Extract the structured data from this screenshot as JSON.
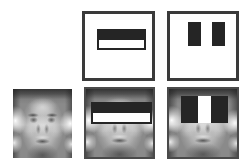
{
  "figure": {
    "background_color": "#ffffff",
    "width": 244,
    "height": 165,
    "grid": {
      "rows": 2,
      "cols": 3
    },
    "dark_color": "#252525",
    "light_color": "#ffffff",
    "border_color": "#3a3a3a",
    "face_frame_color": "#4a4a4a"
  },
  "panels": [
    {
      "id": "top-left-empty",
      "name": "empty-cell",
      "kind": "empty",
      "label": "",
      "x": 2,
      "y": 11,
      "w": 70,
      "h": 70
    },
    {
      "id": "top-middle-template",
      "name": "two-rectangle-feature-template",
      "kind": "feature-template",
      "feature_type": "two-rectangle-horizontal",
      "label": "Two-rectangle feature",
      "description": "Dark band above white band",
      "x": 82,
      "y": 11,
      "w": 73,
      "h": 70,
      "feature": {
        "x": 12,
        "y": 15,
        "w": 49,
        "h": 21
      }
    },
    {
      "id": "top-right-template",
      "name": "three-rectangle-feature-template",
      "kind": "feature-template",
      "feature_type": "three-rectangle-vertical",
      "label": "Three-rectangle feature",
      "description": "Dark, white, dark vertical bands",
      "x": 167,
      "y": 11,
      "w": 72,
      "h": 70,
      "feature": {
        "x": 18,
        "y": 8,
        "w": 37,
        "h": 24
      }
    },
    {
      "id": "bottom-left-face",
      "name": "face-image-plain",
      "kind": "face",
      "label": "Face image",
      "framed": false,
      "x": 13,
      "y": 89,
      "w": 59,
      "h": 69
    },
    {
      "id": "bottom-middle-face",
      "name": "face-image-with-two-rectangle-feature",
      "kind": "face-with-feature",
      "feature_type": "two-rectangle-horizontal",
      "label": "Two-rectangle feature over eyes and cheeks",
      "framed": true,
      "x": 84,
      "y": 87,
      "w": 71,
      "h": 72,
      "feature": {
        "x": 5,
        "y": 13,
        "w": 61,
        "h": 22
      }
    },
    {
      "id": "bottom-right-face",
      "name": "face-image-with-three-rectangle-feature",
      "kind": "face-with-feature",
      "feature_type": "three-rectangle-vertical",
      "label": "Three-rectangle feature over eyes and nose bridge",
      "framed": true,
      "x": 167,
      "y": 87,
      "w": 72,
      "h": 72,
      "feature": {
        "x": 12,
        "y": 7,
        "w": 47,
        "h": 27
      }
    }
  ]
}
